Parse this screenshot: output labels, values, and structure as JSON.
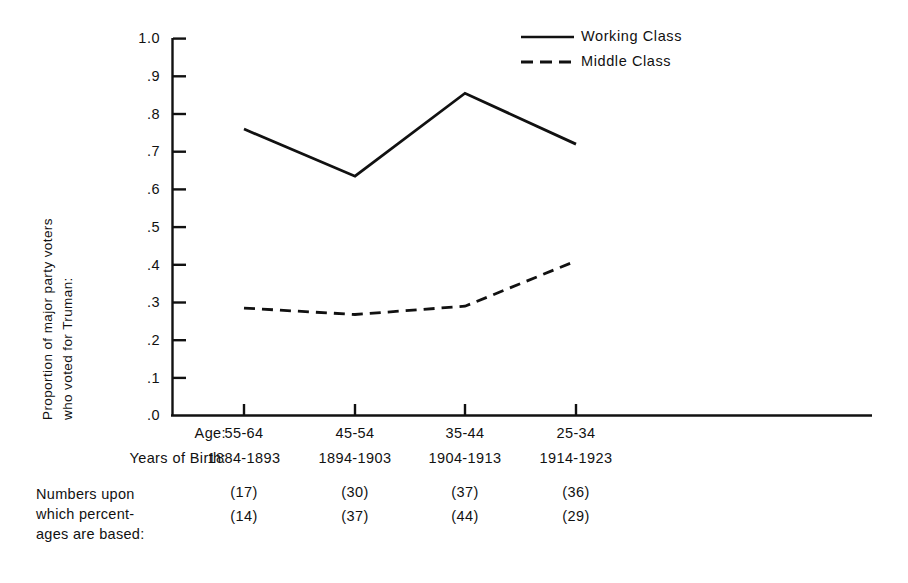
{
  "chart_data": {
    "type": "line",
    "title": "",
    "xlabel": "",
    "ylabel": "Proportion of major party voters who voted for Truman:",
    "ylabel_lines": [
      "Proportion of major party voters",
      "who voted for Truman:"
    ],
    "ylim": [
      0.0,
      1.0
    ],
    "grid": false,
    "legend_position": "top-right",
    "categories": [
      "55-64",
      "45-54",
      "35-44",
      "25-34"
    ],
    "category_row_label": "Age:",
    "secondary_categories": [
      "1884-1893",
      "1894-1903",
      "1904-1913",
      "1914-1923"
    ],
    "secondary_row_label": "Years of Birth:",
    "ytick_labels": [
      "1.0",
      ".9",
      ".8",
      ".7",
      ".6",
      ".5",
      ".4",
      ".3",
      ".2",
      ".1",
      ".0"
    ],
    "ytick_values": [
      1.0,
      0.9,
      0.8,
      0.7,
      0.6,
      0.5,
      0.4,
      0.3,
      0.2,
      0.1,
      0.0
    ],
    "series": [
      {
        "name": "Working Class",
        "style": "solid",
        "values": [
          0.76,
          0.635,
          0.855,
          0.72
        ],
        "n": [
          17,
          30,
          37,
          36
        ]
      },
      {
        "name": "Middle Class",
        "style": "dashed",
        "values": [
          0.285,
          0.268,
          0.29,
          0.41
        ],
        "n": [
          14,
          37,
          44,
          29
        ]
      }
    ],
    "annotations": {
      "n_block_label_lines": [
        "Numbers upon",
        "which percent-",
        "ages are based:"
      ],
      "n_row_1": [
        "(17)",
        "(30)",
        "(37)",
        "(36)"
      ],
      "n_row_2": [
        "(14)",
        "(37)",
        "(44)",
        "(29)"
      ]
    }
  },
  "legend": {
    "items": [
      {
        "label": "Working Class",
        "style": "solid"
      },
      {
        "label": "Middle Class",
        "style": "dashed"
      }
    ]
  },
  "colors": {
    "ink": "#111111",
    "background": "#ffffff"
  }
}
